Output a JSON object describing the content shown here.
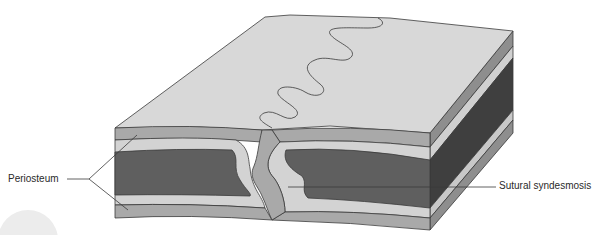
{
  "figure": {
    "type": "anatomical-diagram"
  },
  "labels": {
    "periosteum": "Periosteum",
    "sutural_syndesmosis": "Sutural syndesmosis"
  },
  "colors": {
    "top_surface": "#d8d8d8",
    "periosteum": "#a9a9a9",
    "compact_bone": "#d3d3d3",
    "spongy_bone": "#5f5f5f",
    "side_face_dark": "#3f3f3f",
    "outline": "#3a3a3a",
    "corner_circle": "#ececec"
  }
}
